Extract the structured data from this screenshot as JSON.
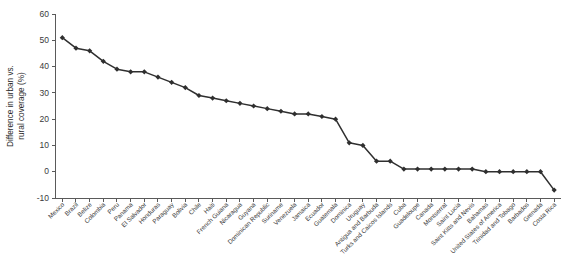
{
  "chart_data": {
    "type": "line",
    "title": "",
    "subtitle": "",
    "xlabel": "",
    "ylabel": "Difference in urban vs. rural coverage (%)",
    "ylim": [
      -10,
      60
    ],
    "yticks": [
      -10,
      0,
      10,
      20,
      30,
      40,
      50,
      60
    ],
    "ytick_labels": [
      "-10",
      "0",
      "10",
      "20",
      "30",
      "40",
      "50",
      "60"
    ],
    "grid": false,
    "legend": "none",
    "marker": "diamond",
    "series_color": "#2f2f2f",
    "categories": [
      "Mexico",
      "Brazil",
      "Belize",
      "Colombia",
      "Peru",
      "Panama",
      "El Salvador",
      "Honduras",
      "Paraguay",
      "Bolivia",
      "Chile",
      "Haiti",
      "French Guiana",
      "Nicaragua",
      "Guyana",
      "Dominican Republic",
      "Suriname",
      "Venezuela",
      "Jamaica",
      "Ecuador",
      "Guatemala",
      "Dominica",
      "Uruguay",
      "Antigua and Barbuda",
      "Turks and Caicos Islands",
      "Cuba",
      "Guadeloupe",
      "Canada",
      "Montserrat",
      "Saint Lucia",
      "Saint Kitts and Nevis",
      "Bahamas",
      "United States of America",
      "Trinidad and Tobago",
      "Barbados",
      "Grenada",
      "Costa Rica"
    ],
    "values": [
      51,
      47,
      46,
      42,
      39,
      38,
      38,
      36,
      34,
      32,
      29,
      28,
      27,
      26,
      25,
      24,
      23,
      22,
      22,
      21,
      20,
      11,
      10,
      4,
      4,
      1,
      1,
      1,
      1,
      1,
      1,
      0,
      0,
      0,
      0,
      0,
      -7
    ]
  }
}
